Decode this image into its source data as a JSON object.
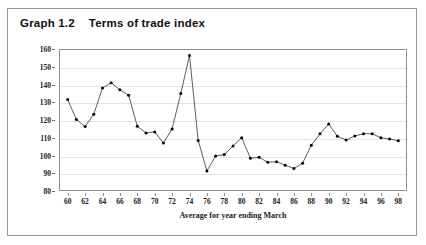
{
  "figure": {
    "label": "Graph 1.2",
    "title": "Terms of trade index"
  },
  "chart_data": {
    "type": "line",
    "title": "Terms of trade index",
    "figure_label": "Graph 1.2",
    "xlabel": "Average for year ending March",
    "ylabel": "1979-89 average = 100",
    "xlim": [
      59,
      99
    ],
    "ylim": [
      80,
      160
    ],
    "ytick_step": 10,
    "xtick_step": 2,
    "grid": true,
    "legend": null,
    "marker": "filled-circle",
    "line_color": "#333333",
    "marker_color": "#000000",
    "y_ticks": [
      80,
      90,
      100,
      110,
      120,
      130,
      140,
      150,
      160
    ],
    "x_ticks": [
      60,
      62,
      64,
      66,
      68,
      70,
      72,
      74,
      76,
      78,
      80,
      82,
      84,
      86,
      88,
      90,
      92,
      94,
      96,
      98
    ],
    "x": [
      60,
      61,
      62,
      63,
      64,
      65,
      66,
      67,
      68,
      69,
      70,
      71,
      72,
      73,
      74,
      75,
      76,
      77,
      78,
      79,
      80,
      81,
      82,
      83,
      84,
      85,
      86,
      87,
      88,
      89,
      90,
      91,
      92,
      93,
      94,
      95,
      96,
      97,
      98
    ],
    "values": [
      131.5,
      120.3,
      116.3,
      123.3,
      138.0,
      141.0,
      137.0,
      134.0,
      116.5,
      112.7,
      113.3,
      107.0,
      115.0,
      135.0,
      156.3,
      108.5,
      91.3,
      99.7,
      100.5,
      105.3,
      110.0,
      98.5,
      99.0,
      96.2,
      96.5,
      94.5,
      92.7,
      95.7,
      105.8,
      112.2,
      117.8,
      110.8,
      108.7,
      111.0,
      112.3,
      112.2,
      110.0,
      109.3,
      108.3
    ]
  }
}
